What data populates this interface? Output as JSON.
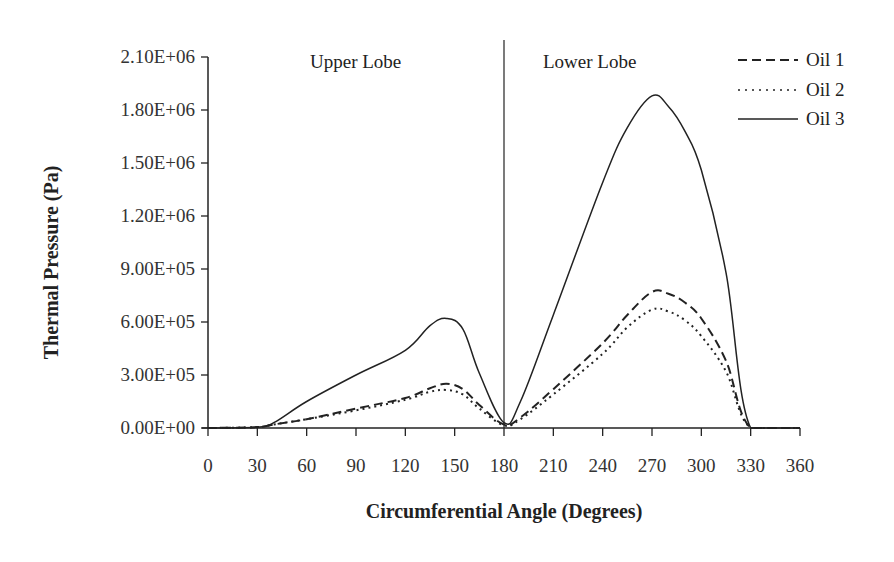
{
  "chart_data": {
    "type": "line",
    "title": "",
    "xlabel": "Circumferential Angle (Degrees)",
    "ylabel": "Thermal Pressure (Pa)",
    "xlim": [
      0,
      360
    ],
    "ylim": [
      0,
      2100000
    ],
    "x_ticks": [
      0,
      30,
      60,
      90,
      120,
      150,
      180,
      210,
      240,
      270,
      300,
      330,
      360
    ],
    "x_tick_labels": [
      "0",
      "30",
      "60",
      "90",
      "120",
      "150",
      "180",
      "210",
      "240",
      "270",
      "300",
      "330",
      "360"
    ],
    "y_ticks": [
      0,
      300000,
      600000,
      900000,
      1200000,
      1500000,
      1800000,
      2100000
    ],
    "y_tick_labels": [
      "0.00E+00",
      "3.00E+05",
      "6.00E+05",
      "9.00E+05",
      "1.20E+06",
      "1.50E+06",
      "1.80E+06",
      "2.10E+06"
    ],
    "grid": false,
    "legend_position": "top-right",
    "annotations": [
      {
        "text": "Upper Lobe",
        "x": 105,
        "y": 2000000
      },
      {
        "text": "Lower Lobe",
        "x": 235,
        "y": 2000000
      }
    ],
    "divider_x": 180,
    "x": [
      0,
      30,
      40,
      60,
      90,
      120,
      135,
      145,
      155,
      165,
      180,
      190,
      210,
      240,
      255,
      270,
      280,
      290,
      300,
      315,
      330,
      360
    ],
    "series": [
      {
        "name": "Oil 1",
        "style": "dashed",
        "values": [
          0,
          5000,
          20000,
          50000,
          110000,
          170000,
          225000,
          250000,
          220000,
          130000,
          20000,
          60000,
          220000,
          480000,
          640000,
          770000,
          760000,
          710000,
          620000,
          380000,
          0,
          0
        ]
      },
      {
        "name": "Oil 2",
        "style": "dotted",
        "values": [
          0,
          5000,
          20000,
          50000,
          100000,
          160000,
          205000,
          215000,
          190000,
          110000,
          15000,
          50000,
          190000,
          420000,
          570000,
          670000,
          660000,
          610000,
          520000,
          320000,
          0,
          0
        ]
      },
      {
        "name": "Oil 3",
        "style": "solid",
        "values": [
          0,
          5000,
          30000,
          150000,
          300000,
          440000,
          580000,
          620000,
          560000,
          310000,
          30000,
          150000,
          640000,
          1390000,
          1700000,
          1880000,
          1820000,
          1680000,
          1460000,
          880000,
          0,
          0
        ]
      }
    ]
  },
  "legend": {
    "items": [
      {
        "label": "Oil 1"
      },
      {
        "label": "Oil 2"
      },
      {
        "label": "Oil 3"
      }
    ]
  }
}
